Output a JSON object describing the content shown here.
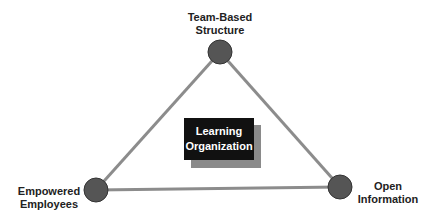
{
  "diagram": {
    "type": "triangle",
    "center": {
      "line1": "Learning",
      "line2": "Organization"
    },
    "nodes": [
      {
        "id": "top",
        "line1": "Team-Based",
        "line2": "Structure",
        "cx": 220,
        "cy": 52
      },
      {
        "id": "bottom-left",
        "line1": "Empowered",
        "line2": "Employees",
        "cx": 96,
        "cy": 190
      },
      {
        "id": "bottom-right",
        "line1": "Open",
        "line2": "Information",
        "cx": 340,
        "cy": 187
      }
    ],
    "colors": {
      "line": "#8c8c8c",
      "node": "#555555",
      "node_border": "#333333",
      "box": "#111111",
      "box_shadow": "#8a8a8a",
      "text": "#222222"
    }
  }
}
